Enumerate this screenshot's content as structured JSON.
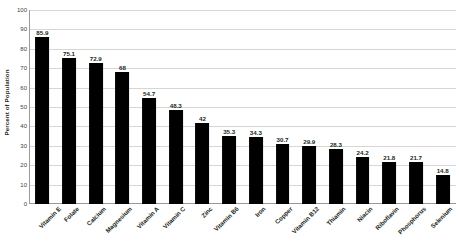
{
  "chart_data": {
    "type": "bar",
    "title": "",
    "xlabel": "",
    "ylabel": "Percent of Population",
    "ylim": [
      0,
      100
    ],
    "ytick_step": 10,
    "yticks": [
      0,
      10,
      20,
      30,
      40,
      50,
      60,
      70,
      80,
      90,
      100
    ],
    "grid": true,
    "legend": "none",
    "orientation": "vertical",
    "bar_color": "#000000",
    "categories": [
      "Vitamin E",
      "Folate",
      "Calcium",
      "Magnesium",
      "Vitamin A",
      "Vitamin C",
      "Zinc",
      "Vitamin B6",
      "Iron",
      "Copper",
      "Vitamin B12",
      "Thiamin",
      "Niacin",
      "Riboflavin",
      "Phosphorus",
      "Selenium"
    ],
    "values": [
      85.9,
      75.1,
      72.9,
      68,
      54.7,
      48.3,
      42,
      35.3,
      34.3,
      30.7,
      29.9,
      28.3,
      24.2,
      21.8,
      21.7,
      14.8
    ],
    "value_labels": [
      "85.9",
      "75.1",
      "72.9",
      "68",
      "54.7",
      "48.3",
      "42",
      "35.3",
      "34.3",
      "30.7",
      "29.9",
      "28.3",
      "24.2",
      "21.8",
      "21.7",
      "14.8"
    ],
    "ytick_labels": [
      "100",
      "90",
      "80",
      "70",
      "60",
      "50",
      "40",
      "30",
      "20",
      "10",
      "0"
    ]
  },
  "colors": {
    "bar": "#000000",
    "grid": "#d6d6d6",
    "axis": "#9a9a9a",
    "text": "#231f20",
    "tick_text": "#404040",
    "background": "#ffffff"
  }
}
